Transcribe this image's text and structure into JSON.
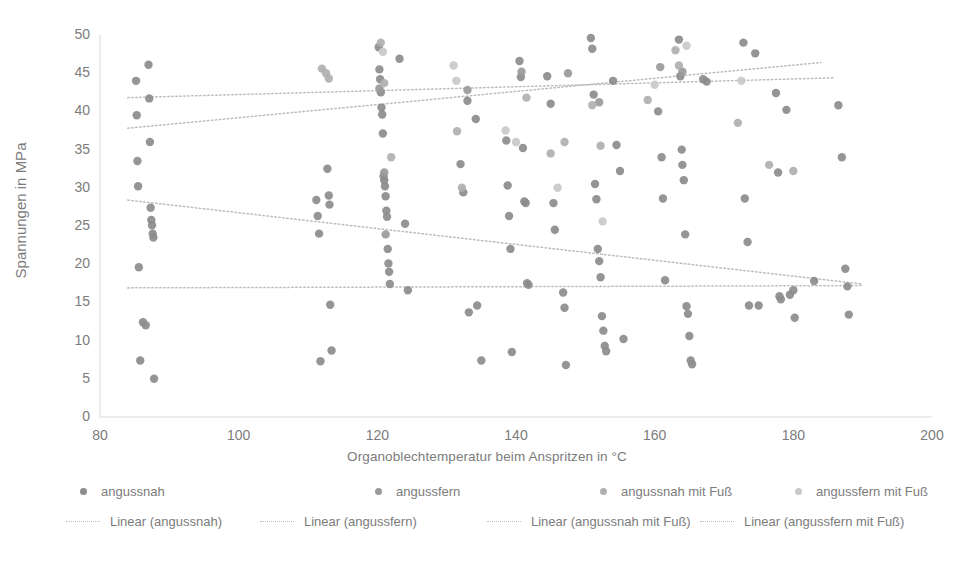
{
  "chart": {
    "type": "scatter",
    "title": "",
    "xlabel": "Organoblechtemperatur beim Anspritzen in °C",
    "ylabel": "Spannungen in MPa",
    "xlim": [
      80,
      200
    ],
    "ylim": [
      0,
      50
    ],
    "xticks": [
      80,
      100,
      120,
      140,
      160,
      180,
      200
    ],
    "yticks": [
      0,
      5,
      10,
      15,
      20,
      25,
      30,
      35,
      40,
      45,
      50
    ],
    "grid": false,
    "legend_position": "bottom"
  },
  "colors": {
    "series_angussnah": "#8c8c8c",
    "series_angussfern": "#9a9a9a",
    "series_angussnah_fuss": "#b0b0b0",
    "series_angussfern_fuss": "#c9c9c9",
    "trend": "#bdbdbd",
    "axis": "#d9d9d9",
    "text": "#7c7c7c"
  },
  "chart_data": {
    "type": "scatter",
    "title": "",
    "xlabel": "Organoblechtemperatur beim Anspritzen in °C",
    "ylabel": "Spannungen in MPa",
    "xlim": [
      80,
      200
    ],
    "ylim": [
      0,
      50
    ],
    "xticks": [
      80,
      100,
      120,
      140,
      160,
      180,
      200
    ],
    "yticks": [
      0,
      5,
      10,
      15,
      20,
      25,
      30,
      35,
      40,
      45,
      50
    ],
    "grid": false,
    "legend_position": "bottom",
    "series": [
      {
        "name": "angussnah",
        "color": "#8c8c8c",
        "marker": "circle",
        "points": [
          [
            85.2,
            44.0
          ],
          [
            85.3,
            39.5
          ],
          [
            85.4,
            33.5
          ],
          [
            85.5,
            30.2
          ],
          [
            85.6,
            19.6
          ],
          [
            85.8,
            7.4
          ],
          [
            86.2,
            12.4
          ],
          [
            86.6,
            12.0
          ],
          [
            87.0,
            46.1
          ],
          [
            87.1,
            41.7
          ],
          [
            87.2,
            36.0
          ],
          [
            87.3,
            27.4
          ],
          [
            87.4,
            25.8
          ],
          [
            87.5,
            25.1
          ],
          [
            87.6,
            24.0
          ],
          [
            87.7,
            23.5
          ],
          [
            87.8,
            5.0
          ],
          [
            111.2,
            28.4
          ],
          [
            111.4,
            26.3
          ],
          [
            111.6,
            24.0
          ],
          [
            111.8,
            7.3
          ],
          [
            112.8,
            32.5
          ],
          [
            113.0,
            29.0
          ],
          [
            113.1,
            27.8
          ],
          [
            113.2,
            14.7
          ],
          [
            113.4,
            8.7
          ],
          [
            120.2,
            48.4
          ],
          [
            120.3,
            45.5
          ],
          [
            120.4,
            44.2
          ],
          [
            120.5,
            42.5
          ],
          [
            120.6,
            40.5
          ],
          [
            120.7,
            39.6
          ],
          [
            120.8,
            37.1
          ],
          [
            120.9,
            31.5
          ],
          [
            121.0,
            31.0
          ],
          [
            121.1,
            30.2
          ],
          [
            121.2,
            28.9
          ],
          [
            121.3,
            27.0
          ],
          [
            121.4,
            26.2
          ],
          [
            121.5,
            22.0
          ],
          [
            121.6,
            20.1
          ],
          [
            121.7,
            19.0
          ],
          [
            121.8,
            17.4
          ],
          [
            123.2,
            46.9
          ],
          [
            124.0,
            25.3
          ],
          [
            124.4,
            16.6
          ],
          [
            132.0,
            33.1
          ],
          [
            132.4,
            29.4
          ],
          [
            133.0,
            41.4
          ],
          [
            133.2,
            13.7
          ],
          [
            134.2,
            39.0
          ],
          [
            134.4,
            14.6
          ],
          [
            135.0,
            7.4
          ],
          [
            138.6,
            36.2
          ],
          [
            138.8,
            30.3
          ],
          [
            139.0,
            26.3
          ],
          [
            139.2,
            22.0
          ],
          [
            139.4,
            8.5
          ],
          [
            140.5,
            46.6
          ],
          [
            140.7,
            44.5
          ],
          [
            141.0,
            35.2
          ],
          [
            141.2,
            28.2
          ],
          [
            141.4,
            28.0
          ],
          [
            141.6,
            17.5
          ],
          [
            141.8,
            17.3
          ],
          [
            144.5,
            44.6
          ],
          [
            145.0,
            41.0
          ],
          [
            145.4,
            28.0
          ],
          [
            145.6,
            24.5
          ],
          [
            146.8,
            16.3
          ],
          [
            147.0,
            14.3
          ],
          [
            147.2,
            6.8
          ],
          [
            150.8,
            49.6
          ],
          [
            151.0,
            48.2
          ],
          [
            151.2,
            42.2
          ],
          [
            151.4,
            30.5
          ],
          [
            151.6,
            28.5
          ],
          [
            151.8,
            22.0
          ],
          [
            152.0,
            20.4
          ],
          [
            152.2,
            18.3
          ],
          [
            152.4,
            13.2
          ],
          [
            152.6,
            11.3
          ],
          [
            152.8,
            9.3
          ],
          [
            153.0,
            8.6
          ],
          [
            154.0,
            44.0
          ],
          [
            154.5,
            35.6
          ],
          [
            155.0,
            32.2
          ],
          [
            155.5,
            10.2
          ],
          [
            160.5,
            40.0
          ],
          [
            161.0,
            34.0
          ],
          [
            161.2,
            28.6
          ],
          [
            161.5,
            17.9
          ],
          [
            163.5,
            49.4
          ],
          [
            163.7,
            44.6
          ],
          [
            163.9,
            35.0
          ],
          [
            164.0,
            33.0
          ],
          [
            164.2,
            31.0
          ],
          [
            164.4,
            23.9
          ],
          [
            164.6,
            14.5
          ],
          [
            164.8,
            13.5
          ],
          [
            165.0,
            10.6
          ],
          [
            165.2,
            7.4
          ],
          [
            165.4,
            6.9
          ],
          [
            167.0,
            44.2
          ],
          [
            167.5,
            43.9
          ],
          [
            172.8,
            49.0
          ],
          [
            173.0,
            28.6
          ],
          [
            173.4,
            22.9
          ],
          [
            173.6,
            14.6
          ],
          [
            174.5,
            47.6
          ],
          [
            175.0,
            14.6
          ],
          [
            177.5,
            42.4
          ],
          [
            177.8,
            32.0
          ],
          [
            178.0,
            15.8
          ],
          [
            178.2,
            15.4
          ],
          [
            179.0,
            40.2
          ],
          [
            179.5,
            16.0
          ],
          [
            180.0,
            16.6
          ],
          [
            180.2,
            13.0
          ],
          [
            183.0,
            17.8
          ],
          [
            186.5,
            40.8
          ],
          [
            187.0,
            34.0
          ],
          [
            187.5,
            19.4
          ],
          [
            187.8,
            17.1
          ],
          [
            188.0,
            13.4
          ]
        ]
      },
      {
        "name": "angussfern",
        "color": "#9a9a9a",
        "marker": "circle",
        "points": [
          [
            120.3,
            43.0
          ],
          [
            121.0,
            32.0
          ],
          [
            121.2,
            23.9
          ],
          [
            133.0,
            42.8
          ],
          [
            140.8,
            45.2
          ],
          [
            147.5,
            45.0
          ],
          [
            152.0,
            41.2
          ],
          [
            160.8,
            45.8
          ],
          [
            164.0,
            45.2
          ]
        ]
      },
      {
        "name": "angussnah mit Fuß",
        "color": "#b0b0b0",
        "marker": "circle",
        "points": [
          [
            112.0,
            45.6
          ],
          [
            112.6,
            45.0
          ],
          [
            113.0,
            44.3
          ],
          [
            120.5,
            49.0
          ],
          [
            121.0,
            43.7
          ],
          [
            122.0,
            34.0
          ],
          [
            131.5,
            37.4
          ],
          [
            132.2,
            30.0
          ],
          [
            141.5,
            41.8
          ],
          [
            145.0,
            34.5
          ],
          [
            147.0,
            36.0
          ],
          [
            151.0,
            40.8
          ],
          [
            152.2,
            35.5
          ],
          [
            159.0,
            41.5
          ],
          [
            163.0,
            48.0
          ],
          [
            163.5,
            46.0
          ],
          [
            172.0,
            38.5
          ],
          [
            176.5,
            33.0
          ],
          [
            180.0,
            32.2
          ]
        ]
      },
      {
        "name": "angussfern mit Fuß",
        "color": "#c9c9c9",
        "marker": "circle",
        "points": [
          [
            120.8,
            47.8
          ],
          [
            131.0,
            46.0
          ],
          [
            131.4,
            44.0
          ],
          [
            138.5,
            37.5
          ],
          [
            140.0,
            36.0
          ],
          [
            146.0,
            30.0
          ],
          [
            152.5,
            25.6
          ],
          [
            160.0,
            43.5
          ],
          [
            164.6,
            48.6
          ],
          [
            172.5,
            44.0
          ]
        ]
      }
    ],
    "trendlines": [
      {
        "name": "Linear (angussnah)",
        "for_series": "angussnah",
        "style": "dotted",
        "color": "#bdbdbd",
        "x0": 84.0,
        "y0": 28.4,
        "x1": 190.0,
        "y1": 17.4
      },
      {
        "name": "Linear (angussfern)",
        "for_series": "angussfern",
        "style": "dotted",
        "color": "#bdbdbd",
        "x0": 84.0,
        "y0": 41.8,
        "x1": 186.0,
        "y1": 44.4
      },
      {
        "name": "Linear (angussnah mit Fuß)",
        "for_series": "angussnah mit Fuß",
        "style": "dotted",
        "color": "#bdbdbd",
        "x0": 84.0,
        "y0": 16.9,
        "x1": 190.0,
        "y1": 17.2
      },
      {
        "name": "Linear (angussfern mit Fuß)",
        "for_series": "angussfern mit Fuß",
        "style": "dotted",
        "color": "#bdbdbd",
        "x0": 84.0,
        "y0": 37.8,
        "x1": 184.0,
        "y1": 46.4
      }
    ]
  },
  "legend": {
    "markers": [
      {
        "label": "angussnah",
        "color": "#8c8c8c"
      },
      {
        "label": "angussfern",
        "color": "#9a9a9a"
      },
      {
        "label": "angussnah mit Fuß",
        "color": "#b0b0b0"
      },
      {
        "label": "angussfern mit Fuß",
        "color": "#c9c9c9"
      }
    ],
    "lines": [
      {
        "label": "Linear (angussnah)",
        "color": "#bdbdbd"
      },
      {
        "label": "Linear (angussfern)",
        "color": "#bdbdbd"
      },
      {
        "label": "Linear (angussnah mit Fuß)",
        "color": "#bdbdbd"
      },
      {
        "label": "Linear (angussfern mit Fuß)",
        "color": "#bdbdbd"
      }
    ]
  }
}
